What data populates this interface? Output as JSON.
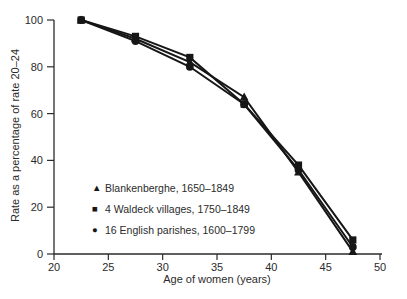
{
  "figure": {
    "background": "#ffffff",
    "text_color": "#2b2b2b"
  },
  "chart_data": {
    "type": "line",
    "title": "",
    "xlabel": "Age of women (years)",
    "ylabel": "Rate as a percentage of rate 20–24",
    "xlim": [
      20,
      50
    ],
    "ylim": [
      0,
      100
    ],
    "x_ticks": [
      20,
      25,
      30,
      35,
      40,
      45,
      50
    ],
    "y_ticks": [
      0,
      20,
      40,
      60,
      80,
      100
    ],
    "grid": false,
    "legend_position": "inside-lower-left",
    "line_color": "#161616",
    "x": [
      22.5,
      27.5,
      32.5,
      37.5,
      42.5,
      47.5
    ],
    "series": [
      {
        "name": "Blankenberghe, 1650–1849",
        "marker": "triangle",
        "glyph": "▲",
        "values": [
          100,
          92,
          82,
          67,
          35,
          1
        ]
      },
      {
        "name": "4 Waldeck villages, 1750–1849",
        "marker": "square",
        "glyph": "■",
        "values": [
          100,
          93,
          84,
          64,
          38,
          6
        ]
      },
      {
        "name": "16 English parishes, 1600–1799",
        "marker": "circle",
        "glyph": "●",
        "values": [
          100,
          91,
          80,
          64,
          36,
          3
        ]
      }
    ]
  }
}
